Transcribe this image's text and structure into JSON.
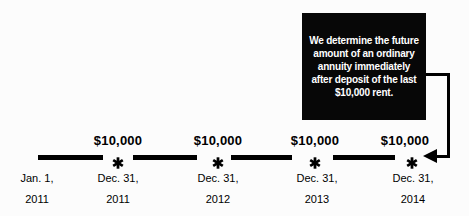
{
  "figure": {
    "background": "#fcfcfc",
    "line_color": "#000000"
  },
  "callout": {
    "bg": "#070707",
    "text_color": "#ffffff",
    "lines": [
      "We determine the future",
      "amount of an ordinary",
      "annuity immediately",
      "after deposit of the last",
      "$10,000 rent."
    ],
    "full_text": "We determine the future amount of an ordinary annuity immediately after deposit of the last $10,000 rent.",
    "points_to": "Dec. 31, 2014 deposit"
  },
  "timeline": {
    "start_label": {
      "line1": "Jan. 1,",
      "line2": "2011"
    },
    "deposits": [
      {
        "amount": "$10,000",
        "date_line1": "Dec. 31,",
        "date_line2": "2011"
      },
      {
        "amount": "$10,000",
        "date_line1": "Dec. 31,",
        "date_line2": "2012"
      },
      {
        "amount": "$10,000",
        "date_line1": "Dec. 31,",
        "date_line2": "2013"
      },
      {
        "amount": "$10,000",
        "date_line1": "Dec. 31,",
        "date_line2": "2014"
      }
    ]
  }
}
